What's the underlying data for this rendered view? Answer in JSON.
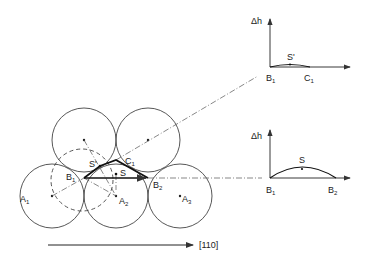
{
  "diagram": {
    "labels": {
      "A1": "A",
      "A1_sub": "1",
      "A2": "A",
      "A2_sub": "2",
      "A3": "A",
      "A3_sub": "3",
      "B1": "B",
      "B1_sub": "1",
      "B2": "B",
      "B2_sub": "2",
      "C1": "C",
      "C1_sub": "1",
      "S": "S",
      "S_prime": "S'"
    },
    "direction_label": "[110]",
    "upper_graph": {
      "y_axis_label": "Δh",
      "point_label": "S'",
      "x_start": "B",
      "x_start_sub": "1",
      "x_end": "C",
      "x_end_sub": "1"
    },
    "lower_graph": {
      "y_axis_label": "Δh",
      "point_label": "S",
      "x_start": "B",
      "x_start_sub": "1",
      "x_end": "B",
      "x_end_sub": "2"
    },
    "colors": {
      "line": "#333333",
      "background": "#ffffff"
    }
  }
}
